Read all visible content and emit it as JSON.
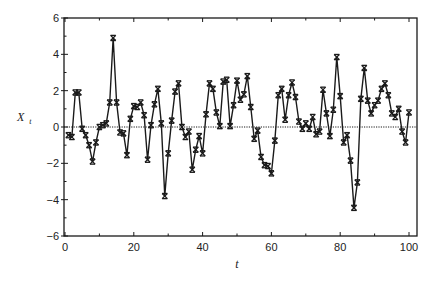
{
  "chart_data": {
    "type": "line",
    "title": "",
    "xlabel": "t",
    "ylabel": "X",
    "ylabel_subscript": "t",
    "xlim": [
      0,
      100
    ],
    "ylim": [
      -6,
      6
    ],
    "xticks": [
      0,
      20,
      40,
      60,
      80,
      100
    ],
    "xtick_labels": [
      "0",
      "20",
      "40",
      "60",
      "80",
      "100"
    ],
    "xminor_ticks": [
      10,
      30,
      50,
      70,
      90
    ],
    "yticks": [
      -6,
      -4,
      -2,
      0,
      2,
      4,
      6
    ],
    "ytick_labels": [
      "−6",
      "−4",
      "−2",
      "0",
      "2",
      "4",
      "6"
    ],
    "yminor_ticks": [
      -5,
      -3,
      -1,
      1,
      3,
      5
    ],
    "grid": false,
    "legend": null,
    "reference_line": {
      "y": 0,
      "style": "dotted"
    },
    "marker": "x-bar",
    "line_color": "#1a1a1a",
    "series": [
      {
        "name": "X_t",
        "x": [
          1,
          2,
          3,
          4,
          5,
          6,
          7,
          8,
          9,
          10,
          11,
          12,
          13,
          14,
          15,
          16,
          17,
          18,
          19,
          20,
          21,
          22,
          23,
          24,
          25,
          26,
          27,
          28,
          29,
          30,
          31,
          32,
          33,
          34,
          35,
          36,
          37,
          38,
          39,
          40,
          41,
          42,
          43,
          44,
          45,
          46,
          47,
          48,
          49,
          50,
          51,
          52,
          53,
          54,
          55,
          56,
          57,
          58,
          59,
          60,
          61,
          62,
          63,
          64,
          65,
          66,
          67,
          68,
          69,
          70,
          71,
          72,
          73,
          74,
          75,
          76,
          77,
          78,
          79,
          80,
          81,
          82,
          83,
          84,
          85,
          86,
          87,
          88,
          89,
          90,
          91,
          92,
          93,
          94,
          95,
          96,
          97,
          98,
          99,
          100
        ],
        "values": [
          -0.45,
          -0.55,
          1.9,
          1.9,
          -0.1,
          -0.45,
          -1.0,
          -1.9,
          -0.85,
          0.0,
          0.1,
          0.2,
          1.35,
          4.9,
          1.35,
          -0.3,
          -0.35,
          -1.55,
          0.45,
          1.15,
          1.1,
          1.35,
          0.65,
          -1.8,
          0.1,
          1.25,
          2.1,
          0.2,
          -3.8,
          -1.45,
          0.35,
          1.95,
          2.4,
          0.0,
          -0.55,
          -0.25,
          -2.35,
          -1.25,
          -0.5,
          -1.45,
          0.7,
          2.4,
          2.1,
          0.8,
          0.05,
          2.5,
          2.6,
          0.05,
          1.2,
          2.55,
          1.5,
          1.8,
          2.8,
          1.1,
          -0.65,
          -0.2,
          -1.65,
          -2.1,
          -2.15,
          -2.55,
          -0.75,
          1.75,
          2.1,
          0.4,
          1.75,
          2.45,
          1.65,
          0.3,
          -0.1,
          0.2,
          -0.1,
          0.55,
          -0.4,
          -0.25,
          2.05,
          0.75,
          -0.5,
          0.95,
          3.85,
          1.7,
          -0.85,
          -0.45,
          -1.85,
          -4.45,
          -3.05,
          1.55,
          3.25,
          1.45,
          0.75,
          1.2,
          1.45,
          2.1,
          2.4,
          1.75,
          0.75,
          0.55,
          1.0,
          -0.25,
          -0.85,
          0.8
        ]
      }
    ]
  },
  "layout": {
    "frame": {
      "left": 64,
      "top": 18,
      "right": 417,
      "bottom": 236
    },
    "x0_px": 65,
    "x100_px": 409,
    "y_top_px": 18,
    "y_bottom_px": 236
  }
}
